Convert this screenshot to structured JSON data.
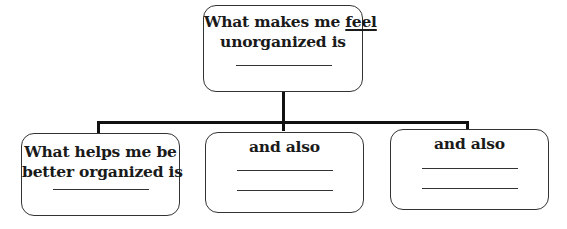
{
  "diagram": {
    "type": "tree",
    "root": {
      "text_before": "What makes me ",
      "text_emphasis": "feel",
      "text_line2": "unorganized is",
      "blank_lines": 1
    },
    "children": [
      {
        "line1": "What helps me be",
        "line2": "better organized is",
        "blank_lines": 1
      },
      {
        "line1": "and also",
        "blank_lines": 2
      },
      {
        "line1": "and also",
        "blank_lines": 2
      }
    ],
    "colors": {
      "stroke": "#333333",
      "connector": "#111111",
      "text": "#1a1a1a",
      "background": "#ffffff"
    }
  }
}
